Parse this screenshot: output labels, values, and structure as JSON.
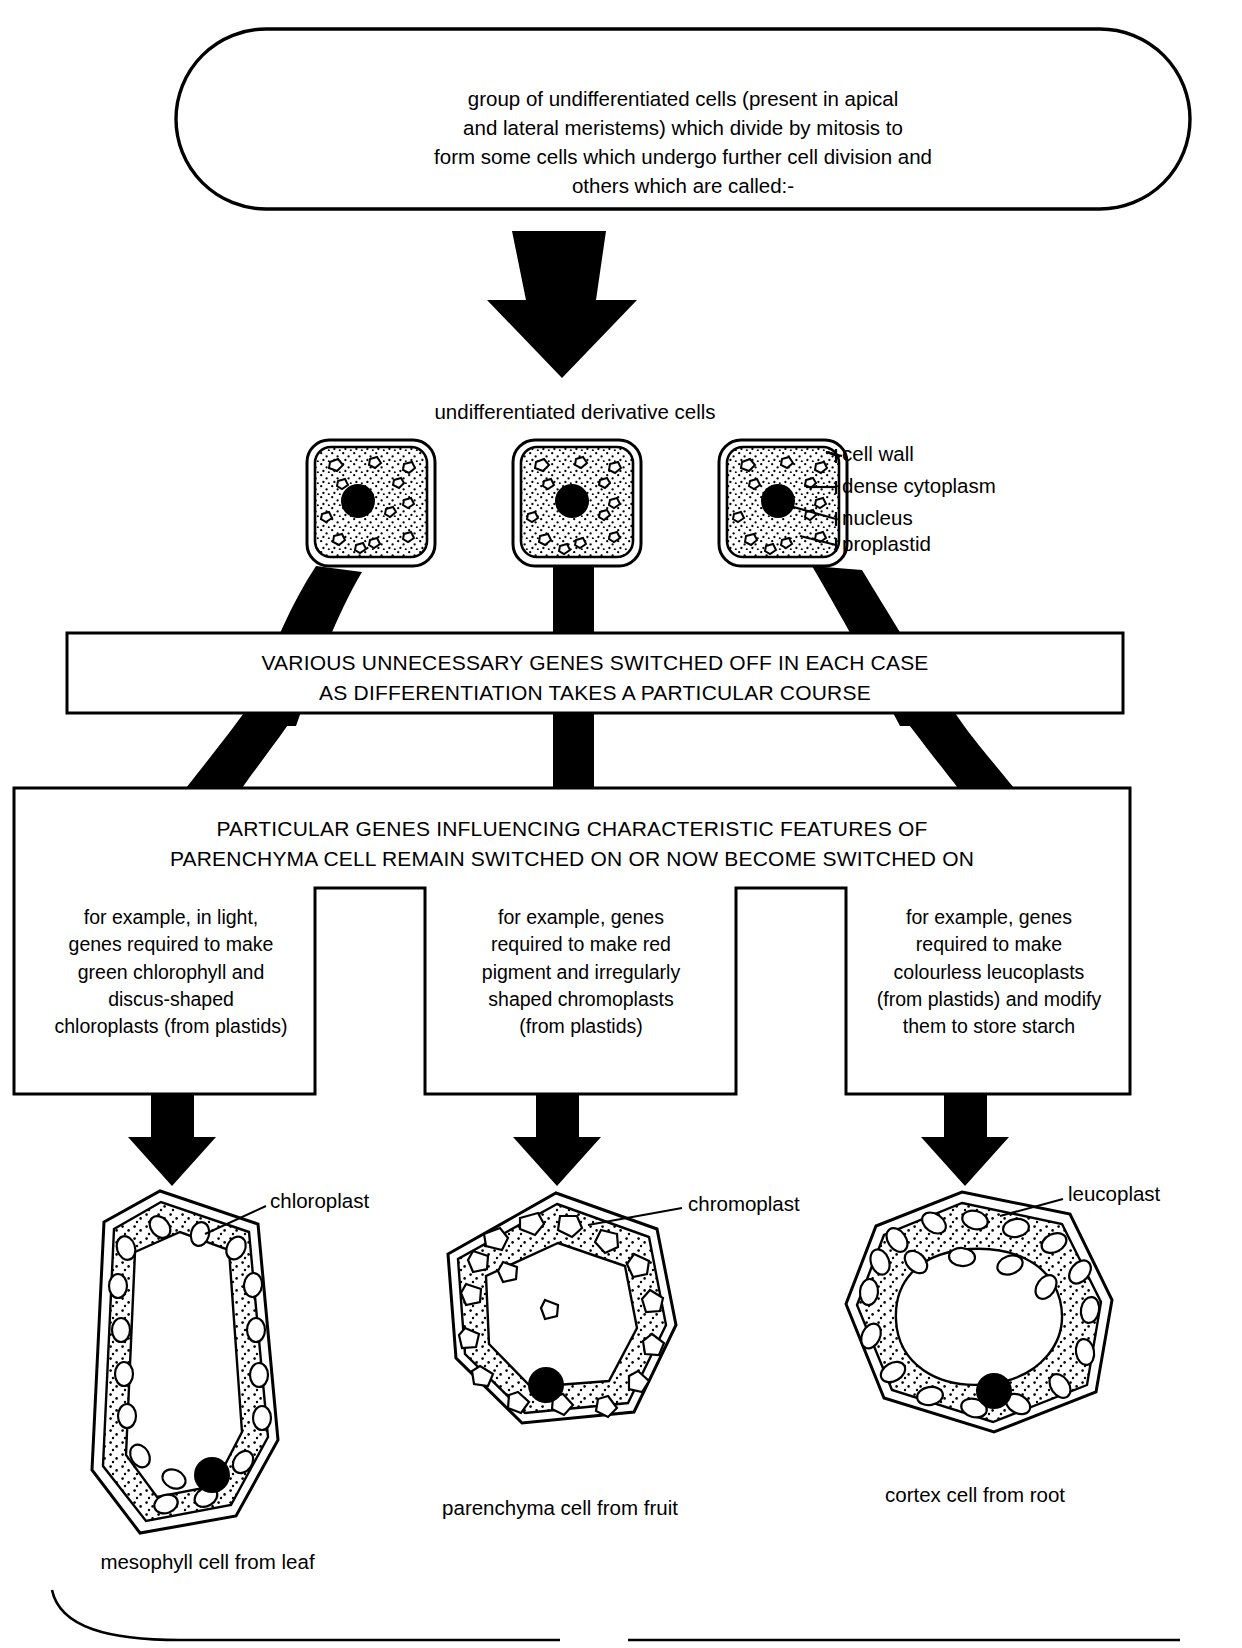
{
  "diagram": {
    "top_capsule": {
      "lines": [
        "group of undifferentiated cells (present in apical",
        "and lateral meristems) which divide by mitosis to",
        "form some cells which undergo further cell division and",
        "others which are called:-"
      ]
    },
    "derivative_heading": "undifferentiated derivative cells",
    "meristem_cell_labels": [
      "cell wall",
      "dense cytoplasm",
      "nucleus",
      "proplastid"
    ],
    "band_switch_off": {
      "lines": [
        "VARIOUS UNNECESSARY GENES SWITCHED OFF IN EACH CASE",
        "AS DIFFERENTIATION TAKES A PARTICULAR COURSE"
      ]
    },
    "band_switch_on": {
      "lines": [
        "PARTICULAR GENES INFLUENCING  CHARACTERISTIC FEATURES OF",
        "PARENCHYMA CELL REMAIN SWITCHED ON OR NOW BECOME SWITCHED ON"
      ]
    },
    "examples": [
      {
        "id": "chloroplast-example",
        "lines": [
          "for example, in light,",
          "genes required to make",
          "green chlorophyll and",
          "discus-shaped",
          "chloroplasts (from plastids)"
        ]
      },
      {
        "id": "chromoplast-example",
        "lines": [
          "for example, genes",
          "required to make red",
          "pigment and irregularly",
          "shaped chromoplasts",
          "(from plastids)"
        ]
      },
      {
        "id": "leucoplast-example",
        "lines": [
          "for example, genes",
          "required to make",
          "colourless leucoplasts",
          "(from plastids) and modify",
          "them to store starch"
        ]
      }
    ],
    "result_cells": [
      {
        "id": "mesophyll-cell",
        "organelle_label": "chloroplast",
        "caption": "mesophyll cell from leaf"
      },
      {
        "id": "fruit-parenchyma-cell",
        "organelle_label": "chromoplast",
        "caption": "parenchyma cell from fruit"
      },
      {
        "id": "root-cortex-cell",
        "organelle_label": "leucoplast",
        "caption": "cortex cell from root"
      }
    ],
    "colors": {
      "ink": "#000000",
      "paper": "#ffffff",
      "stipple": "#000000"
    }
  }
}
